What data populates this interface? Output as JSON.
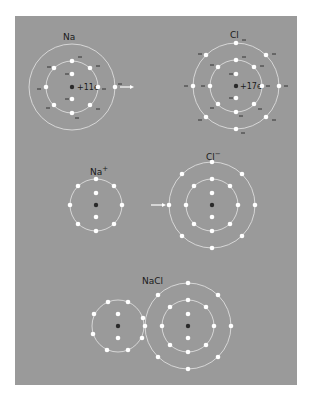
{
  "diagram": {
    "colors": {
      "page_background": "#ffffff",
      "panel_background": "#9a9a9a",
      "shell": "#e6e6e6",
      "electron": "#ffffff",
      "nucleus": "#2a2a2a",
      "text": "#1a1a1a"
    },
    "stages": [
      {
        "name": "neutral-atoms",
        "atoms": [
          {
            "id": "na",
            "label": "Na",
            "nucleus_charge": "+11e",
            "cx": 72,
            "cy": 87,
            "shells": [
              8,
              1
            ],
            "core": 2,
            "electron_sign": "−"
          },
          {
            "id": "cl",
            "label": "Cl",
            "nucleus_charge": "+17e",
            "cx": 236,
            "cy": 86,
            "shells": [
              8,
              7
            ],
            "core": 2,
            "electron_sign": "−"
          }
        ],
        "arrow": "electron transfer"
      },
      {
        "name": "ions",
        "atoms": [
          {
            "id": "na-ion",
            "label": "Na",
            "superscript": "+",
            "cx": 96,
            "cy": 205,
            "shells": [
              8
            ],
            "core": 2
          },
          {
            "id": "cl-ion",
            "label": "Cl",
            "superscript": "−",
            "cx": 212,
            "cy": 205,
            "shells": [
              8,
              8
            ],
            "core": 2
          }
        ]
      },
      {
        "name": "compound",
        "label": "NaCl",
        "atoms": [
          {
            "id": "na-in-nacl",
            "cx": 118,
            "cy": 326,
            "shells": [
              8
            ],
            "core": 2
          },
          {
            "id": "cl-in-nacl",
            "cx": 188,
            "cy": 326,
            "shells": [
              8,
              8
            ],
            "core": 2
          }
        ]
      }
    ]
  }
}
